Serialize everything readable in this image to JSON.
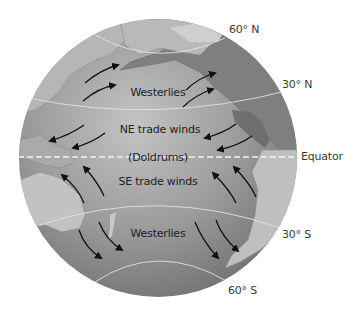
{
  "diagram": {
    "type": "globe-wind-belts",
    "colors": {
      "ocean": "#8f8f8f",
      "ocean_light": "#bdbdbd",
      "land": "#b3b3b3",
      "land_dark": "#7a7a7a",
      "latitude_line": "#e2e2e2",
      "equator_line": "#f4f4f4",
      "arrow": "#111111",
      "label": "#3a3a3a"
    },
    "latitude_labels": {
      "lat_60n": "60° N",
      "lat_30n": "30° N",
      "equator": "Equator",
      "lat_30s": "30° S",
      "lat_60s": "60° S"
    },
    "wind_belts": {
      "westerlies_north": "Westerlies",
      "ne_trade_winds": "NE trade winds",
      "doldrums": "(Doldrums)",
      "se_trade_winds": "SE trade winds",
      "westerlies_south": "Westerlies"
    }
  }
}
